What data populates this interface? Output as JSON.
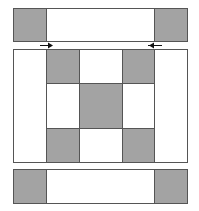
{
  "diagram": {
    "title": "",
    "colors": {
      "shaded": "#a3a3a3",
      "unshaded": "#ffffff",
      "line": "#555555"
    },
    "top_strip": {
      "cells": [
        "shaded",
        "unshaded",
        "shaded"
      ]
    },
    "center_block": {
      "grid": [
        [
          "unshaded",
          "shaded",
          "unshaded",
          "shaded",
          "unshaded"
        ],
        [
          "unshaded",
          "unshaded",
          "shaded",
          "unshaded",
          "unshaded"
        ],
        [
          "unshaded",
          "shaded",
          "unshaded",
          "shaded",
          "unshaded"
        ]
      ]
    },
    "bottom_strip": {
      "cells": [
        "shaded",
        "unshaded",
        "shaded"
      ]
    },
    "arrows": [
      {
        "direction": "right",
        "position": "left"
      },
      {
        "direction": "left",
        "position": "right"
      }
    ]
  }
}
